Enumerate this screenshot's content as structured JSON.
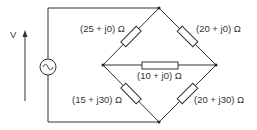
{
  "diagram": {
    "type": "ac-bridge-circuit",
    "source": {
      "label": "V",
      "symbol": "ac-source-icon"
    },
    "impedances": {
      "top_left": "(25 + j0) Ω",
      "top_right": "(20 + j0) Ω",
      "middle": "(10 + j0) Ω",
      "bottom_left": "(15 + j30) Ω",
      "bottom_right": "(20 + j30) Ω"
    },
    "colors": {
      "wire": "#333333",
      "background": "#ffffff"
    }
  }
}
